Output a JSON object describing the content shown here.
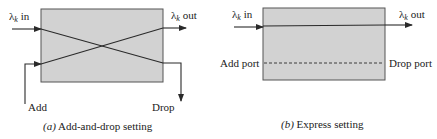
{
  "figures": [
    {
      "id": "a",
      "caption_prefix": "(a)",
      "caption_text": " Add-and-drop setting",
      "labels": {
        "in": "λk in",
        "in_lambda": "λ",
        "in_sub": "k",
        "in_suffix": " in",
        "out_lambda": "λ",
        "out_sub": "k",
        "out_suffix": " out",
        "add": "Add",
        "drop": "Drop"
      }
    },
    {
      "id": "b",
      "caption_prefix": "(b)",
      "caption_text": " Express setting",
      "labels": {
        "in_lambda": "λ",
        "in_sub": "k",
        "in_suffix": " in",
        "out_lambda": "λ",
        "out_sub": "k",
        "out_suffix": " out",
        "add_port": "Add port",
        "drop_port": "Drop port"
      }
    }
  ],
  "colors": {
    "box_fill": "#d2d2d2",
    "line": "#2a2a2a"
  }
}
